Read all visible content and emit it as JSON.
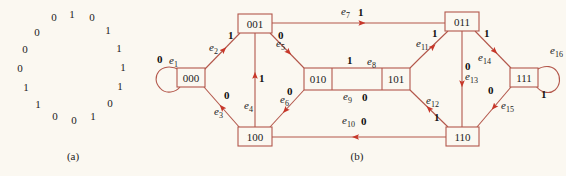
{
  "panel_a": {
    "caption": "(a)",
    "sequence_clockwise_from_top": [
      "1",
      "0",
      "1",
      "1",
      "1",
      "1",
      "0",
      "1",
      "0",
      "0",
      "1",
      "1",
      "0",
      "0",
      "0",
      "0"
    ],
    "bits": [
      {
        "v": "1",
        "x": 72,
        "y": 14
      },
      {
        "v": "0",
        "x": 92,
        "y": 17
      },
      {
        "v": "1",
        "x": 108,
        "y": 30
      },
      {
        "v": "1",
        "x": 119,
        "y": 48
      },
      {
        "v": "1",
        "x": 123,
        "y": 67
      },
      {
        "v": "1",
        "x": 120,
        "y": 86
      },
      {
        "v": "0",
        "x": 110,
        "y": 103
      },
      {
        "v": "1",
        "x": 93,
        "y": 116
      },
      {
        "v": "0",
        "x": 74,
        "y": 120
      },
      {
        "v": "0",
        "x": 55,
        "y": 116
      },
      {
        "v": "1",
        "x": 38,
        "y": 104
      },
      {
        "v": "1",
        "x": 26,
        "y": 87
      },
      {
        "v": "0",
        "x": 20,
        "y": 68
      },
      {
        "v": "0",
        "x": 25,
        "y": 49
      },
      {
        "v": "0",
        "x": 37,
        "y": 32
      },
      {
        "v": "0",
        "x": 54,
        "y": 17
      }
    ]
  },
  "panel_b": {
    "caption": "(b)",
    "colors": {
      "line": "#b3574b",
      "arrow": "#c7372a",
      "box": "#b3574b"
    },
    "nodes": [
      {
        "id": "000",
        "label": "000",
        "x": 177,
        "y": 68,
        "w": 28,
        "h": 19
      },
      {
        "id": "001",
        "label": "001",
        "x": 238,
        "y": 14,
        "w": 34,
        "h": 19
      },
      {
        "id": "010",
        "label": "010",
        "x": 304,
        "y": 68,
        "w": 28,
        "h": 22
      },
      {
        "id": "101",
        "label": "101",
        "x": 382,
        "y": 68,
        "w": 28,
        "h": 22
      },
      {
        "id": "011",
        "label": "011",
        "x": 445,
        "y": 12,
        "w": 34,
        "h": 19
      },
      {
        "id": "100",
        "label": "100",
        "x": 238,
        "y": 127,
        "w": 34,
        "h": 19
      },
      {
        "id": "110",
        "label": "110",
        "x": 446,
        "y": 127,
        "w": 33,
        "h": 19
      },
      {
        "id": "111",
        "label": "111",
        "x": 510,
        "y": 68,
        "w": 28,
        "h": 19
      }
    ],
    "edges": [
      {
        "name": "e1",
        "sub": "1",
        "from": "000",
        "to": "000",
        "weight": "0"
      },
      {
        "name": "e2",
        "sub": "2",
        "from": "000",
        "to": "001",
        "weight": "1"
      },
      {
        "name": "e3",
        "sub": "3",
        "from": "100",
        "to": "000",
        "weight": "0"
      },
      {
        "name": "e4",
        "sub": "4",
        "from": "100",
        "to": "001",
        "weight": "1"
      },
      {
        "name": "e5",
        "sub": "5",
        "from": "001",
        "to": "010",
        "weight": "0"
      },
      {
        "name": "e6",
        "sub": "6",
        "from": "010",
        "to": "100",
        "weight": "0"
      },
      {
        "name": "e7",
        "sub": "7",
        "from": "001",
        "to": "011",
        "weight": "1"
      },
      {
        "name": "e8",
        "sub": "8",
        "from": "010",
        "to": "101",
        "weight": "1"
      },
      {
        "name": "e9",
        "sub": "9",
        "from": "101",
        "to": "010",
        "weight": "0"
      },
      {
        "name": "e10",
        "sub": "10",
        "from": "110",
        "to": "100",
        "weight": "0"
      },
      {
        "name": "e11",
        "sub": "11",
        "from": "101",
        "to": "011",
        "weight": "1"
      },
      {
        "name": "e12",
        "sub": "12",
        "from": "110",
        "to": "101",
        "weight": "1"
      },
      {
        "name": "e13",
        "sub": "13",
        "from": "011",
        "to": "110",
        "weight": "0"
      },
      {
        "name": "e14",
        "sub": "14",
        "from": "011",
        "to": "111",
        "weight": "1"
      },
      {
        "name": "e15",
        "sub": "15",
        "from": "111",
        "to": "110",
        "weight": "0"
      },
      {
        "name": "e16",
        "sub": "16",
        "from": "111",
        "to": "111",
        "weight": "1"
      }
    ]
  }
}
